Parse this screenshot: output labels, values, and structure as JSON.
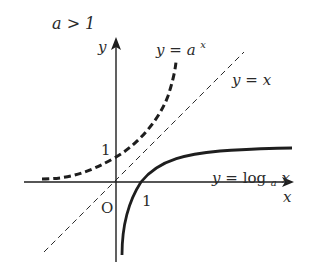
{
  "title": "a > 1",
  "axes": {
    "x_label": "x",
    "y_label": "y",
    "origin_label": "O"
  },
  "ticks": {
    "y_one": "1",
    "x_one": "1"
  },
  "curves": {
    "exponential": {
      "label_lhs": "y",
      "label_eq": "=",
      "label_base": "a",
      "label_exp": "x",
      "style": "dashed-thick"
    },
    "identity": {
      "label_lhs": "y",
      "label_eq": "=",
      "label_rhs": "x",
      "style": "dashed-thin"
    },
    "logarithm": {
      "label_lhs": "y",
      "label_eq": "=",
      "label_fn": "log",
      "label_base": "a",
      "label_arg": "x",
      "style": "solid-thick"
    }
  },
  "colors": {
    "ink": "#1e1e1e",
    "text": "#2a2a2a",
    "background": "#ffffff"
  }
}
